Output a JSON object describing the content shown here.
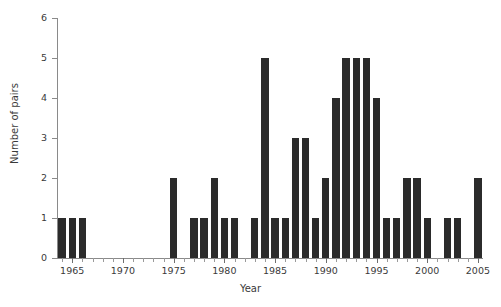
{
  "chart_data": {
    "type": "bar",
    "title": "",
    "xlabel": "Year",
    "ylabel": "Number of pairs",
    "xlim": [
      1964,
      2005
    ],
    "ylim": [
      0,
      6
    ],
    "yticks": [
      0,
      1,
      2,
      3,
      4,
      5,
      6
    ],
    "xticks_major": [
      1965,
      1970,
      1975,
      1980,
      1985,
      1990,
      1995,
      2000,
      2005
    ],
    "xtick_labels": [
      "1965",
      "1970",
      "1975",
      "1980",
      "1985",
      "1990",
      "1995",
      "2000",
      "2005"
    ],
    "ytick_labels": [
      "0",
      "1",
      "2",
      "3",
      "4",
      "5",
      "6"
    ],
    "grid": false,
    "legend": false,
    "bar_color": "#2b2b2b",
    "axis_color": "#8a8a8a",
    "categories": [
      1964,
      1965,
      1966,
      1967,
      1968,
      1969,
      1970,
      1971,
      1972,
      1973,
      1974,
      1975,
      1976,
      1977,
      1978,
      1979,
      1980,
      1981,
      1982,
      1983,
      1984,
      1985,
      1986,
      1987,
      1988,
      1989,
      1990,
      1991,
      1992,
      1993,
      1994,
      1995,
      1996,
      1997,
      1998,
      1999,
      2000,
      2001,
      2002,
      2003,
      2004,
      2005
    ],
    "values": [
      1,
      1,
      1,
      0,
      0,
      0,
      0,
      0,
      0,
      0,
      0,
      2,
      0,
      1,
      1,
      2,
      1,
      1,
      0,
      1,
      5,
      1,
      1,
      3,
      3,
      1,
      2,
      4,
      5,
      5,
      5,
      4,
      1,
      1,
      2,
      2,
      1,
      0,
      1,
      1,
      0,
      2
    ]
  }
}
